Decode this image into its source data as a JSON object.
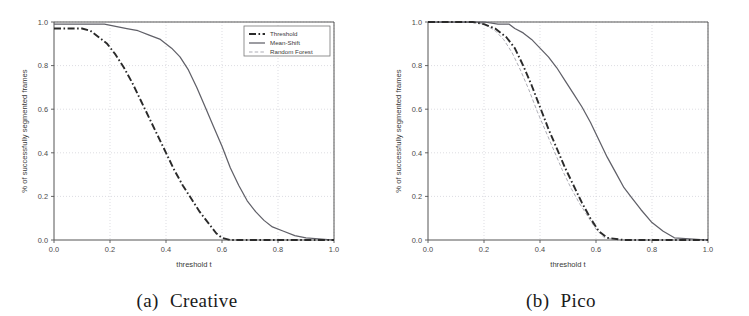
{
  "figure": {
    "panels": [
      {
        "caption_label": "(a)",
        "caption_title": "Creative",
        "show_legend": true
      },
      {
        "caption_label": "(b)",
        "caption_title": "Pico",
        "show_legend": false
      }
    ]
  },
  "chart_data": [
    {
      "type": "line",
      "title": "(a) Creative",
      "xlabel": "threshold t",
      "ylabel": "% of successfully segmented frames",
      "xlim": [
        0.0,
        1.0
      ],
      "ylim": [
        0.0,
        1.0
      ],
      "xticks": [
        "0.0",
        "0.2",
        "0.4",
        "0.6",
        "0.8",
        "1.0"
      ],
      "yticks": [
        "0.0",
        "0.2",
        "0.4",
        "0.6",
        "0.8",
        "1.0"
      ],
      "xtick_values": [
        0.0,
        0.2,
        0.4,
        0.6,
        0.8,
        1.0
      ],
      "ytick_values": [
        0.0,
        0.2,
        0.4,
        0.6,
        0.8,
        1.0
      ],
      "grid": true,
      "legend_position": "upper right",
      "legend_entries": [
        "Threshold",
        "Mean-Shift",
        "Random Forest"
      ],
      "series": [
        {
          "name": "Threshold",
          "style": "dashdot",
          "color": "#2a2a2a",
          "x": [
            0.0,
            0.05,
            0.1,
            0.13,
            0.16,
            0.19,
            0.22,
            0.25,
            0.28,
            0.31,
            0.34,
            0.37,
            0.4,
            0.43,
            0.46,
            0.49,
            0.52,
            0.55,
            0.58,
            0.6,
            0.63,
            0.7,
            0.8,
            0.9,
            1.0
          ],
          "y": [
            0.97,
            0.97,
            0.97,
            0.96,
            0.93,
            0.9,
            0.85,
            0.79,
            0.72,
            0.64,
            0.56,
            0.48,
            0.4,
            0.32,
            0.25,
            0.19,
            0.13,
            0.08,
            0.03,
            0.01,
            0.0,
            0.0,
            0.0,
            0.0,
            0.0
          ]
        },
        {
          "name": "Mean-Shift",
          "style": "solid",
          "color": "#606068",
          "x": [
            0.0,
            0.1,
            0.18,
            0.22,
            0.26,
            0.3,
            0.34,
            0.38,
            0.42,
            0.45,
            0.48,
            0.51,
            0.54,
            0.57,
            0.6,
            0.63,
            0.66,
            0.69,
            0.72,
            0.75,
            0.78,
            0.82,
            0.86,
            0.9,
            1.0
          ],
          "y": [
            0.99,
            0.99,
            0.99,
            0.98,
            0.97,
            0.96,
            0.94,
            0.92,
            0.88,
            0.84,
            0.78,
            0.7,
            0.61,
            0.52,
            0.43,
            0.33,
            0.25,
            0.18,
            0.13,
            0.09,
            0.06,
            0.04,
            0.02,
            0.01,
            0.0
          ]
        },
        {
          "name": "Random Forest",
          "style": "dashed",
          "color": "#a8a8b0",
          "x": [
            0.0,
            0.1,
            0.18,
            0.22,
            0.25,
            0.28,
            0.31,
            0.34,
            0.37,
            0.4,
            0.43,
            0.45,
            0.47,
            0.49,
            0.52,
            0.55,
            0.58,
            0.62,
            0.66,
            0.7,
            0.74,
            0.78,
            0.82,
            0.86,
            0.9,
            1.0
          ]
        }
      ]
    },
    {
      "type": "line",
      "title": "(b) Pico",
      "xlabel": "threshold t",
      "ylabel": "% of successfully segmented frames",
      "xlim": [
        0.0,
        1.0
      ],
      "ylim": [
        0.0,
        1.0
      ],
      "xticks": [
        "0.0",
        "0.2",
        "0.4",
        "0.6",
        "0.8",
        "1.0"
      ],
      "yticks": [
        "0.0",
        "0.2",
        "0.4",
        "0.6",
        "0.8",
        "1.0"
      ],
      "xtick_values": [
        0.0,
        0.2,
        0.4,
        0.6,
        0.8,
        1.0
      ],
      "ytick_values": [
        0.0,
        0.2,
        0.4,
        0.6,
        0.8,
        1.0
      ],
      "grid": true,
      "legend_position": "none",
      "legend_entries": [],
      "series": [
        {
          "name": "Threshold",
          "style": "dashdot",
          "color": "#2a2a2a",
          "x": [
            0.0,
            0.1,
            0.16,
            0.2,
            0.24,
            0.28,
            0.31,
            0.34,
            0.37,
            0.4,
            0.43,
            0.46,
            0.49,
            0.52,
            0.55,
            0.58,
            0.61,
            0.64,
            0.7,
            0.8,
            0.9,
            1.0
          ],
          "y": [
            1.0,
            1.0,
            1.0,
            0.99,
            0.97,
            0.93,
            0.88,
            0.8,
            0.71,
            0.61,
            0.51,
            0.42,
            0.33,
            0.25,
            0.17,
            0.1,
            0.04,
            0.01,
            0.0,
            0.0,
            0.0,
            0.0
          ]
        },
        {
          "name": "Mean-Shift",
          "style": "solid",
          "color": "#606068",
          "x": [
            0.0,
            0.12,
            0.2,
            0.25,
            0.29,
            0.31,
            0.34,
            0.37,
            0.4,
            0.43,
            0.46,
            0.49,
            0.52,
            0.55,
            0.58,
            0.61,
            0.64,
            0.67,
            0.7,
            0.73,
            0.76,
            0.8,
            0.84,
            0.88,
            1.0
          ],
          "y": [
            1.0,
            1.0,
            1.0,
            0.99,
            0.99,
            0.97,
            0.95,
            0.92,
            0.88,
            0.84,
            0.79,
            0.73,
            0.67,
            0.61,
            0.54,
            0.46,
            0.38,
            0.31,
            0.24,
            0.19,
            0.14,
            0.08,
            0.04,
            0.01,
            0.0
          ]
        },
        {
          "name": "Random Forest",
          "style": "dashed",
          "color": "#a8a8b0",
          "x": [
            0.0,
            0.1,
            0.16,
            0.2,
            0.24,
            0.27,
            0.3,
            0.33,
            0.36,
            0.39,
            0.42,
            0.45,
            0.48,
            0.51,
            0.54,
            0.57,
            0.6,
            0.63,
            0.7,
            0.8,
            0.9,
            1.0
          ],
          "y": [
            1.0,
            1.0,
            1.0,
            0.99,
            0.96,
            0.92,
            0.86,
            0.78,
            0.69,
            0.59,
            0.5,
            0.41,
            0.32,
            0.24,
            0.17,
            0.11,
            0.05,
            0.01,
            0.0,
            0.0,
            0.0,
            0.0
          ]
        }
      ]
    }
  ]
}
